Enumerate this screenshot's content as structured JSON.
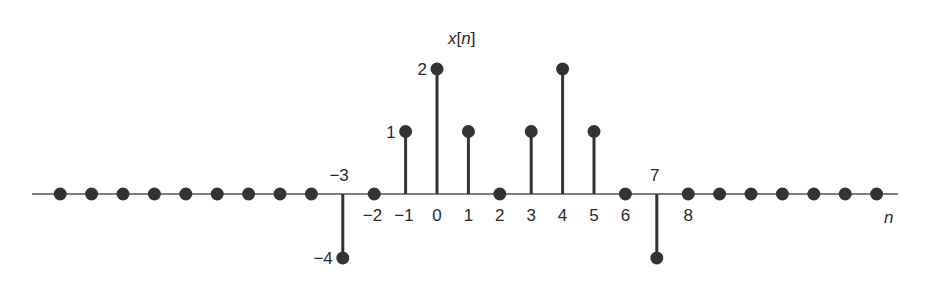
{
  "chart_data": {
    "type": "stem",
    "title": "x[n]",
    "xlabel": "n",
    "ylabel": "",
    "grid": false,
    "legend": null,
    "x": [
      -12,
      -11,
      -10,
      -9,
      -8,
      -7,
      -6,
      -5,
      -4,
      -3,
      -2,
      -1,
      0,
      1,
      2,
      3,
      4,
      5,
      6,
      7,
      8,
      9,
      10,
      11,
      12,
      13,
      14
    ],
    "values": [
      0,
      0,
      0,
      0,
      0,
      0,
      0,
      0,
      0,
      -4,
      0,
      1,
      2,
      1,
      0,
      1,
      2,
      1,
      0,
      -4,
      0,
      0,
      0,
      0,
      0,
      0,
      0
    ],
    "tick_labels": [
      {
        "n": -3,
        "text": "−3",
        "pos": "above"
      },
      {
        "n": -2,
        "text": "−2",
        "pos": "below"
      },
      {
        "n": -1,
        "text": "−1",
        "pos": "below"
      },
      {
        "n": 0,
        "text": "0",
        "pos": "below"
      },
      {
        "n": 1,
        "text": "1",
        "pos": "below"
      },
      {
        "n": 2,
        "text": "2",
        "pos": "below"
      },
      {
        "n": 3,
        "text": "3",
        "pos": "below"
      },
      {
        "n": 4,
        "text": "4",
        "pos": "below"
      },
      {
        "n": 5,
        "text": "5",
        "pos": "below"
      },
      {
        "n": 6,
        "text": "6",
        "pos": "below"
      },
      {
        "n": 7,
        "text": "7",
        "pos": "above"
      },
      {
        "n": 8,
        "text": "8",
        "pos": "below"
      }
    ],
    "value_labels": [
      {
        "n": -1,
        "text": "1"
      },
      {
        "n": 0,
        "text": "2"
      },
      {
        "n": -3,
        "text": "−4"
      }
    ],
    "xlim": [
      -12,
      14
    ],
    "ylim": [
      -4,
      2
    ],
    "colors": {
      "stem": "#333333",
      "axis": "#555555",
      "text": "#2a2a2a"
    }
  }
}
